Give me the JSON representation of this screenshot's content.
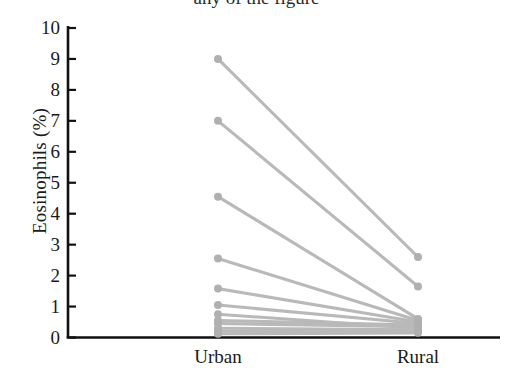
{
  "figure": {
    "cropped_header_text": "any of the figure",
    "background_color": "#ffffff",
    "axis_color": "#111111",
    "line_color": "#b9b9b9",
    "marker_color": "#b0b0b0"
  },
  "axes": {
    "ylabel": "Eosinophils (%)",
    "yticks": [
      "10",
      "9",
      "8",
      "7",
      "6",
      "5",
      "4",
      "3",
      "2",
      "1",
      "0"
    ],
    "xticks": [
      "Urban",
      "Rural"
    ]
  },
  "chart_data": {
    "type": "line",
    "title": "",
    "subtitle": "",
    "xlabel": "",
    "ylabel": "Eosinophils (%)",
    "categories": [
      "Urban",
      "Rural"
    ],
    "ylim": [
      0,
      10
    ],
    "xlim_categories": [
      "Urban",
      "Rural"
    ],
    "ytick_values": [
      0,
      1,
      2,
      3,
      4,
      5,
      6,
      7,
      8,
      9,
      10
    ],
    "grid": false,
    "legend": false,
    "legend_position": "none",
    "annotations": [],
    "series": [
      {
        "name": "subject-1",
        "values": [
          9.0,
          2.6
        ]
      },
      {
        "name": "subject-2",
        "values": [
          7.0,
          1.65
        ]
      },
      {
        "name": "subject-3",
        "values": [
          4.55,
          0.6
        ]
      },
      {
        "name": "subject-4",
        "values": [
          2.55,
          0.55
        ]
      },
      {
        "name": "subject-5",
        "values": [
          1.58,
          0.5
        ]
      },
      {
        "name": "subject-6",
        "values": [
          1.05,
          0.45
        ]
      },
      {
        "name": "subject-7",
        "values": [
          0.55,
          0.4
        ]
      },
      {
        "name": "subject-8",
        "values": [
          0.3,
          0.25
        ]
      },
      {
        "name": "subject-9",
        "values": [
          0.2,
          0.2
        ]
      },
      {
        "name": "subject-10",
        "values": [
          0.12,
          0.15
        ]
      },
      {
        "name": "subject-11",
        "values": [
          0.45,
          0.35
        ]
      },
      {
        "name": "subject-12",
        "values": [
          0.75,
          0.3
        ]
      }
    ]
  }
}
